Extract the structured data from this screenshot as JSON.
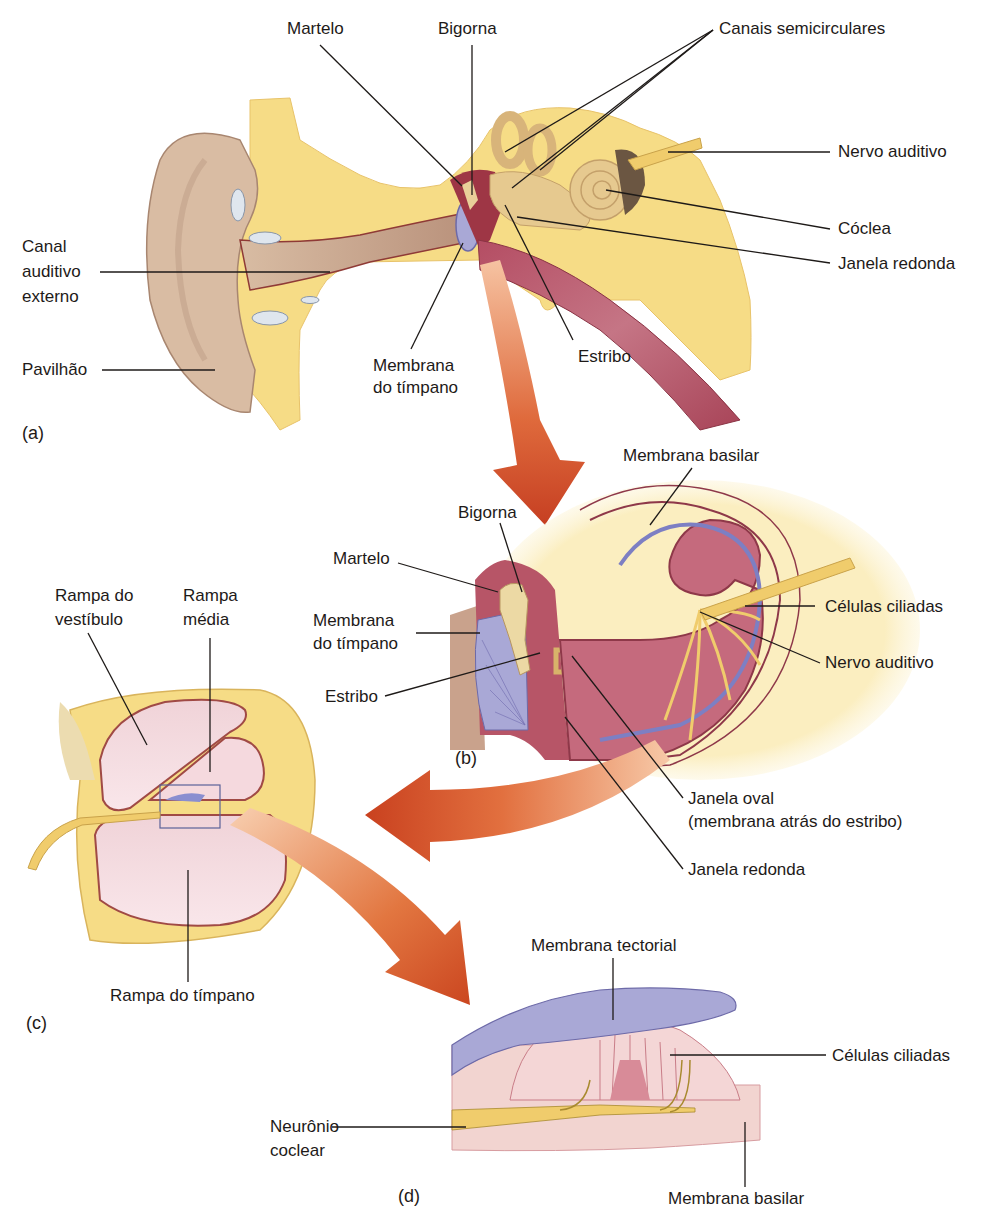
{
  "figure": {
    "panels": {
      "a": {
        "tag": "(a)",
        "labels": {
          "martelo": "Martelo",
          "bigorna": "Bigorna",
          "canais": "Canais semicirculares",
          "nervo": "Nervo auditivo",
          "coclea": "Cóclea",
          "janela_redonda": "Janela redonda",
          "canal_l1": "Canal",
          "canal_l2": "auditivo",
          "canal_l3": "externo",
          "pavilhao": "Pavilhão",
          "membrana_l1": "Membrana",
          "membrana_l2": "do tímpano",
          "estribo": "Estribo"
        }
      },
      "b": {
        "tag": "(b)",
        "labels": {
          "membrana_basilar": "Membrana basilar",
          "bigorna": "Bigorna",
          "martelo": "Martelo",
          "membrana_l1": "Membrana",
          "membrana_l2": "do tímpano",
          "estribo": "Estribo",
          "celulas": "Células ciliadas",
          "nervo": "Nervo auditivo",
          "janela_oval_l1": "Janela oval",
          "janela_oval_l2": "(membrana atrás do estribo)",
          "janela_redonda": "Janela redonda"
        }
      },
      "c": {
        "tag": "(c)",
        "labels": {
          "vestibulo_l1": "Rampa do",
          "vestibulo_l2": "vestíbulo",
          "media_l1": "Rampa",
          "media_l2": "média",
          "timpano": "Rampa do tímpano"
        }
      },
      "d": {
        "tag": "(d)",
        "labels": {
          "tectorial": "Membrana tectorial",
          "celulas": "Células ciliadas",
          "neuronio_l1": "Neurônio",
          "neuronio_l2": "coclear",
          "basilar": "Membrana basilar"
        }
      }
    },
    "colors": {
      "bone": "#f6dc86",
      "skin": "#d9bca3",
      "canal": "#c39c7f",
      "tissue": "#b75567",
      "tympanum": "#a9a8d6",
      "arrow": "#cf4a25",
      "nerve": "#f0cc6c",
      "line": "#1e1a18"
    }
  }
}
